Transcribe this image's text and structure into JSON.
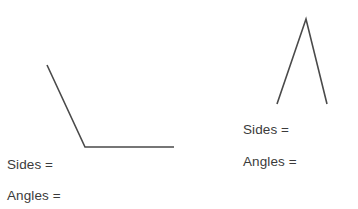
{
  "page": {
    "background_color": "#ffffff",
    "stroke_color": "#4a4a4a",
    "text_color": "#3b3b3b",
    "width": 358,
    "height": 209
  },
  "figures": [
    {
      "id": "left-figure",
      "name": "obtuse-angle-figure",
      "description": "open angle made of two connected line segments",
      "points": [
        {
          "x": 47,
          "y": 65
        },
        {
          "x": 85,
          "y": 147
        },
        {
          "x": 174,
          "y": 147
        }
      ],
      "labels": {
        "sides": "Sides =",
        "angles": "Angles ="
      }
    },
    {
      "id": "right-figure",
      "name": "peak-angle-figure",
      "description": "inverted V shape made of two connected line segments",
      "points": [
        {
          "x": 277,
          "y": 104
        },
        {
          "x": 306,
          "y": 19
        },
        {
          "x": 327,
          "y": 104
        }
      ],
      "labels": {
        "sides": "Sides =",
        "angles": "Angles ="
      }
    }
  ]
}
